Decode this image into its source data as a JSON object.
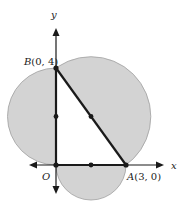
{
  "diagram": {
    "axes": {
      "x_label": "x",
      "y_label": "y",
      "origin_label": "O"
    },
    "points": {
      "A": {
        "name": "A",
        "coords": "(3, 0)"
      },
      "B": {
        "name": "B",
        "coords": "(0, 4)"
      }
    },
    "colors": {
      "shade": "#d3d3d3",
      "stroke": "#1a1a1a",
      "circle_edge": "#9a9a9a"
    }
  }
}
